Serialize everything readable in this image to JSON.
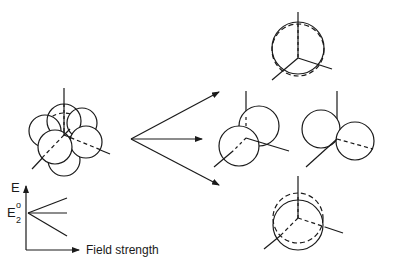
{
  "figure": {
    "stroke_color": "#1a1a1a",
    "background": "#ffffff"
  },
  "energy_plot": {
    "y_label": "E",
    "level_label_base": "E",
    "level_label_sub": "2",
    "level_label_sup": "o",
    "x_label": "Field strength",
    "lines": [
      "increasing",
      "constant",
      "decreasing"
    ]
  },
  "panels": [
    {
      "id": "unperturbed",
      "label": "combined state"
    },
    {
      "id": "top",
      "label": "shifted up"
    },
    {
      "id": "middle-left",
      "label": "split pair A"
    },
    {
      "id": "middle-right",
      "label": "split pair B"
    },
    {
      "id": "bottom",
      "label": "shifted down"
    }
  ]
}
